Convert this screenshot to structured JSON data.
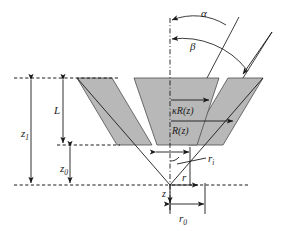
{
  "figure": {
    "type": "technical-line-diagram",
    "background_color": "#ffffff",
    "line_color": "#1a1a1a",
    "fill_gray": "#b8b8b8",
    "fill_gray_stroke": "#4d4d4d"
  },
  "labels": {
    "alpha": "α",
    "beta": "β",
    "kappa_R_z": "κR(z)",
    "R_z": "R(z)",
    "L": "L",
    "z1_base": "z",
    "z1_sub": "1",
    "z0_base": "z",
    "z0_sub": "0",
    "z": "z",
    "r": "r",
    "ri_base": "r",
    "ri_sub": "i",
    "r0_base": "r",
    "r0_sub": "0"
  },
  "geometry": {
    "axis_x": 170,
    "top_dashed_y": 78,
    "mid_dashed_y": 145,
    "baseline_y": 185,
    "apex_x": 170,
    "apex_y": 185,
    "r0_line_x": 205,
    "ri_line_x": 190
  },
  "annotations": {
    "angle_alpha_description": "outer half-angle arc from vertical axis",
    "angle_beta_description": "inner half-angle arc from vertical axis",
    "kappa_R_description": "scaled radius dimension arrow",
    "R_description": "radius dimension arrow",
    "L_description": "vertical extent of tapered band",
    "z1_description": "height from baseline to top dashed level",
    "z0_description": "height from baseline to mid dashed level",
    "r0_description": "radial distance at baseline",
    "ri_description": "inner radius near apex"
  }
}
